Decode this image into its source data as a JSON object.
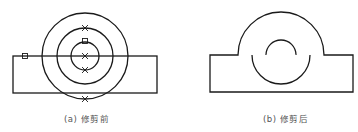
{
  "figure_a": {
    "caption": "(a) 修剪前",
    "rect": {
      "x": 13,
      "y": 56,
      "w": 144,
      "h": 37
    },
    "circles": [
      {
        "cx": 85,
        "cy": 56,
        "r": 43
      },
      {
        "cx": 85,
        "cy": 56,
        "r": 28
      },
      {
        "cx": 85,
        "cy": 56,
        "r": 14
      }
    ],
    "x_markers": [
      {
        "x": 85,
        "y": 28
      },
      {
        "x": 85,
        "y": 56
      },
      {
        "x": 85,
        "y": 70
      },
      {
        "x": 85,
        "y": 99
      }
    ],
    "square_markers": [
      {
        "x": 85,
        "y": 41
      },
      {
        "x": 25,
        "y": 56
      }
    ]
  },
  "figure_b": {
    "caption": "(b) 修剪后",
    "rect": {
      "x": 210,
      "y": 55,
      "w": 143,
      "h": 37
    },
    "center": {
      "cx": 281,
      "cy": 55
    },
    "outer_r": 43,
    "middle_r": 29,
    "inner_r": 15
  },
  "colors": {
    "stroke": "#1a1a1a",
    "caption": "#555555"
  }
}
